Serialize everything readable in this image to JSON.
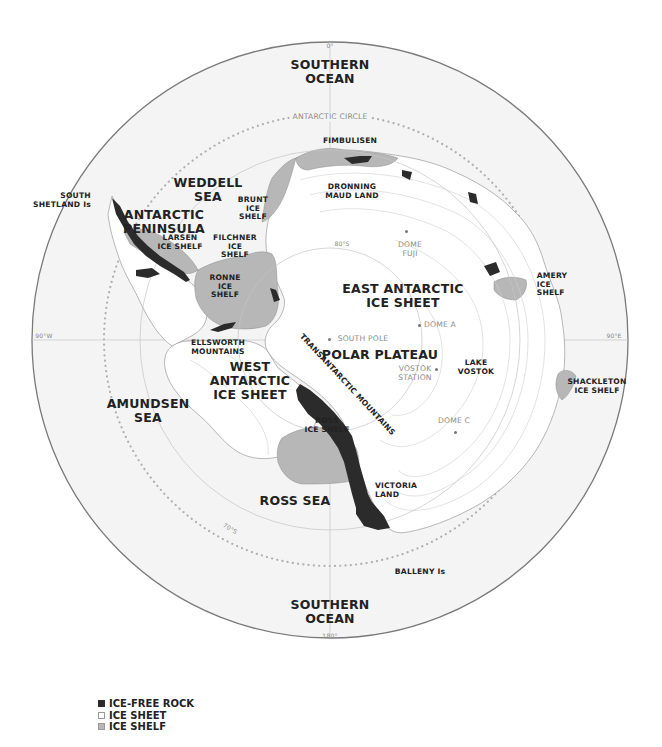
{
  "colors": {
    "ice_free_rock": "#2b2b2b",
    "ice_sheet": "#ffffff",
    "ice_shelf": "#b7b7b7",
    "ocean": "#f4f4f4",
    "graticule": "#bdbdbd",
    "antarctic_circle": "#b0b0b0",
    "label": "#222222",
    "secondary_label": "#8a8a8a"
  },
  "graticule": {
    "top": "0°",
    "bottom": "180°",
    "left": "90°W",
    "right": "90°E",
    "lat80": "80°S",
    "lat70": "70°S",
    "antarctic_circle": "ANTARCTIC CIRCLE"
  },
  "labels": {
    "southern_ocean_top": [
      "SOUTHERN",
      "OCEAN"
    ],
    "southern_ocean_bottom": [
      "SOUTHERN",
      "OCEAN"
    ],
    "weddell_sea": [
      "WEDDELL",
      "SEA"
    ],
    "amundsen_sea": [
      "AMUNDSEN",
      "SEA"
    ],
    "ross_sea": "ROSS SEA",
    "antarctic_peninsula": [
      "ANTARCTIC",
      "PENINSULA"
    ],
    "south_shetland": [
      "SOUTH",
      "SHETLAND Is"
    ],
    "larsen": [
      "LARSEN",
      "ICE SHELF"
    ],
    "brunt": [
      "BRUNT",
      "ICE",
      "SHELF"
    ],
    "filchner": [
      "FILCHNER",
      "ICE",
      "SHELF"
    ],
    "ronne": [
      "RONNE",
      "ICE",
      "SHELF"
    ],
    "fimbulisen": "FIMBULISEN",
    "dronning_maud": [
      "DRONNING",
      "MAUD LAND"
    ],
    "dome_fuji": [
      "DOME",
      "FUJI"
    ],
    "amery": [
      "AMERY",
      "ICE",
      "SHELF"
    ],
    "east_antarctic": [
      "EAST ANTARCTIC",
      "ICE SHEET"
    ],
    "dome_a": "DOME A",
    "south_pole": "SOUTH POLE",
    "polar_plateau": "POLAR PLATEAU",
    "ellsworth": [
      "ELLSWORTH",
      "MOUNTAINS"
    ],
    "west_antarctic": [
      "WEST",
      "ANTARCTIC",
      "ICE SHEET"
    ],
    "transantarctic": "TRANSANTARCTIC MOUNTAINS",
    "vostok_station": [
      "VOSTOK",
      "STATION"
    ],
    "lake_vostok": [
      "LAKE",
      "VOSTOK"
    ],
    "shackleton": [
      "SHACKLETON",
      "ICE SHELF"
    ],
    "dome_c": "DOME C",
    "ross_ice_shelf": [
      "ROSS",
      "ICE SHELF"
    ],
    "victoria_land": [
      "VICTORIA",
      "LAND"
    ],
    "balleny": "BALLENY Is",
    "contour_3000": "3000m",
    "contour_2000": "2000m"
  },
  "legend": [
    {
      "label": "ICE-FREE ROCK",
      "swatch": "ice_free_rock"
    },
    {
      "label": "ICE SHEET",
      "swatch": "ice_sheet"
    },
    {
      "label": "ICE SHELF",
      "swatch": "ice_shelf"
    }
  ]
}
